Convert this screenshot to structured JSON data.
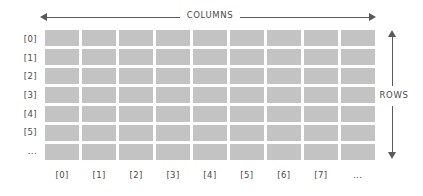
{
  "diagram": {
    "title_top": "COLUMNS",
    "title_right": "ROWS",
    "grid": {
      "column_count": 9,
      "row_count": 7,
      "cell_color": "#c3c3c3",
      "gap_color": "#ffffff"
    },
    "row_labels": [
      "[0]",
      "[1]",
      "[2]",
      "[3]",
      "[4]",
      "[5]",
      "..."
    ],
    "column_labels": [
      "[0]",
      "[1]",
      "[2]",
      "[3]",
      "[4]",
      "[5]",
      "[6]",
      "[7]",
      "..."
    ],
    "arrow_color": "#5a5a5a",
    "text_color": "#4a4a4a"
  }
}
